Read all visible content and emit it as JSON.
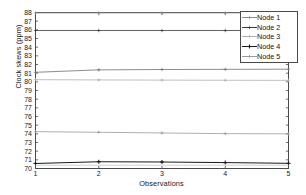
{
  "chart_data": {
    "type": "line",
    "title": "",
    "xlabel": "Observations",
    "ylabel": "Clock skews (ppm)",
    "x": [
      1,
      2,
      3,
      4,
      5
    ],
    "xlim": [
      1,
      5
    ],
    "ylim": [
      70,
      88
    ],
    "xticks": [
      "1",
      "2",
      "3",
      "4",
      "5"
    ],
    "yticks": [
      "70",
      "71",
      "72",
      "73",
      "74",
      "75",
      "76",
      "77",
      "78",
      "79",
      "80",
      "81",
      "82",
      "83",
      "84",
      "85",
      "86",
      "87",
      "88"
    ],
    "grid": false,
    "legend_position": "top-right",
    "series": [
      {
        "name": "Node 1",
        "color": "#8c8c8c",
        "marker": "plus",
        "values": [
          87.95,
          87.95,
          87.95,
          87.95,
          87.95
        ]
      },
      {
        "name": "Node 2",
        "color": "#3a3a3a",
        "marker": "plus",
        "values": [
          85.92,
          85.92,
          85.92,
          85.92,
          85.92
        ]
      },
      {
        "name": "Node 3",
        "color": "#b0b0b0",
        "marker": "plus",
        "values": [
          80.25,
          80.22,
          80.2,
          80.18,
          80.17
        ]
      },
      {
        "name": "Node 4",
        "color": "#1a1a1a",
        "marker": "plus-filled",
        "values": [
          70.58,
          70.78,
          70.75,
          70.68,
          70.6
        ]
      },
      {
        "name": "Node 5",
        "color": "#9a9a9a",
        "marker": "plus",
        "values": [
          74.25,
          74.18,
          74.1,
          74.02,
          74.0
        ]
      },
      {
        "name": "Node 6",
        "color": "#6e6e6e",
        "marker": "plus",
        "values": [
          81.1,
          81.38,
          81.42,
          81.44,
          81.46
        ]
      },
      {
        "name": "Node 7",
        "color": "#c4c4c4",
        "marker": "none",
        "values": [
          70.38,
          70.38,
          70.38,
          70.38,
          70.38
        ]
      }
    ]
  },
  "axis": {
    "line_color": "#4a4a4a",
    "tick_color": "#4a4a4a"
  },
  "legend": {
    "entries": [
      "Node 1",
      "Node 2",
      "Node 3",
      "Node 4",
      "Node 5"
    ]
  }
}
